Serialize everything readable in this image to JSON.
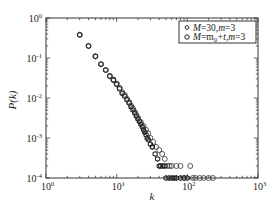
{
  "chart_data": {
    "type": "scatter",
    "title": "",
    "xlabel": "k",
    "ylabel": "P(k)",
    "xscale": "log",
    "yscale": "log",
    "xlim": [
      1,
      1000
    ],
    "ylim": [
      0.0001,
      1
    ],
    "x_ticks": [
      "10^0",
      "10^1",
      "10^2",
      "10^3"
    ],
    "y_ticks": [
      "10^0",
      "10^-1",
      "10^-2",
      "10^-3",
      "10^-4"
    ],
    "grid": false,
    "legend_position": "upper right",
    "series": [
      {
        "name": "M=30,m=3",
        "marker": "hexagon-open",
        "x": [
          3,
          4,
          5,
          6,
          7,
          8,
          9,
          10,
          11,
          12,
          13,
          14,
          15,
          16,
          17,
          18,
          19,
          20,
          21,
          22,
          23,
          24,
          25,
          26,
          27,
          28,
          30,
          32,
          35,
          38,
          40,
          42,
          45,
          48,
          50,
          55,
          60,
          65,
          70,
          80,
          90,
          100
        ],
        "y": [
          0.38,
          0.2,
          0.11,
          0.07,
          0.05,
          0.035,
          0.028,
          0.022,
          0.017,
          0.013,
          0.011,
          0.009,
          0.0075,
          0.006,
          0.005,
          0.0042,
          0.0035,
          0.003,
          0.0026,
          0.0022,
          0.0019,
          0.0016,
          0.0014,
          0.0012,
          0.001,
          0.0009,
          0.0007,
          0.0006,
          0.0004,
          0.0003,
          0.0002,
          0.0002,
          0.0002,
          0.0002,
          0.0001,
          0.0001,
          0.0001,
          0.0001,
          0.0001,
          0.0001,
          0.0001,
          0.0001
        ]
      },
      {
        "name": "M=m0+t,m=3",
        "marker": "circle-open",
        "x": [
          3,
          4,
          5,
          6,
          7,
          8,
          9,
          10,
          11,
          12,
          13,
          14,
          15,
          16,
          17,
          18,
          19,
          20,
          22,
          24,
          26,
          28,
          30,
          33,
          36,
          40,
          44,
          48,
          52,
          56,
          60,
          70,
          80,
          90,
          110,
          120,
          130,
          150,
          170,
          200,
          230
        ],
        "y": [
          0.38,
          0.2,
          0.11,
          0.07,
          0.05,
          0.036,
          0.029,
          0.023,
          0.018,
          0.014,
          0.012,
          0.0095,
          0.008,
          0.0065,
          0.0055,
          0.0045,
          0.0038,
          0.0032,
          0.0025,
          0.002,
          0.0016,
          0.0013,
          0.001,
          0.0008,
          0.0006,
          0.0005,
          0.0004,
          0.0003,
          0.0002,
          0.0002,
          0.0002,
          0.0002,
          0.0002,
          0.0001,
          0.0002,
          0.0001,
          0.0001,
          0.0001,
          0.0001,
          0.0001,
          0.0001
        ]
      }
    ]
  },
  "legend": {
    "entries": [
      {
        "label_pre": "M",
        "label_mid": "=30,",
        "label_m": "m",
        "label_post": "=3"
      },
      {
        "label_pre": "M",
        "label_mid": "=m",
        "label_sub": "0",
        "label_mid2": "+t,",
        "label_m": "m",
        "label_post": "=3"
      }
    ]
  },
  "axes": {
    "xlabel": "k",
    "ylabel": "P(k)",
    "x_tick_base": "10",
    "x_tick_exps": [
      "0",
      "1",
      "2",
      "3"
    ],
    "y_tick_base": "10",
    "y_tick_exps": [
      "0",
      "-1",
      "-2",
      "-3",
      "-4"
    ]
  }
}
